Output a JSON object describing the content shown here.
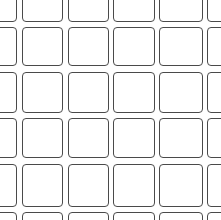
{
  "image": {
    "description": "Grid of rounded square outlines (tile pattern), line art on white",
    "background_color": "#ffffff",
    "stroke_color": "#4a4a4a"
  },
  "grid": {
    "columns_x": [
      [
        -28,
        17
      ],
      [
        22,
        63
      ],
      [
        68,
        109
      ],
      [
        113,
        155
      ],
      [
        159,
        203
      ],
      [
        207,
        250
      ]
    ],
    "rows_y": [
      [
        -25,
        22
      ],
      [
        27,
        66
      ],
      [
        72,
        113
      ],
      [
        118,
        158
      ],
      [
        164,
        207
      ],
      [
        212,
        255
      ]
    ]
  }
}
